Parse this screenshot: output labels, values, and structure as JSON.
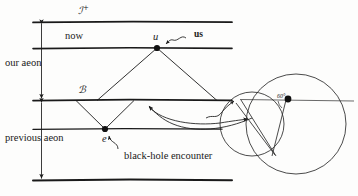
{
  "figure": {
    "type": "conformal-cyclic-cosmology-spacetime-diagram",
    "background_color": "#fdfdfc",
    "ink_color": "#1a1a1a"
  },
  "labels": {
    "scri_plus": "ℐ",
    "scri_plus_sup": "+",
    "now": "now",
    "us": "us",
    "u_point": "u",
    "our_aeon": "our aeon",
    "crossover_B": "ℬ",
    "previous_aeon": "previous aeon",
    "e_point": "e",
    "black_hole_encounter": "black-hole encounter",
    "angle_sixty": "60°"
  },
  "structure": {
    "horizontal_lines": [
      {
        "name": "scri-plus-line",
        "y": 22,
        "x1": 33,
        "x2": 232,
        "weight": 1.6
      },
      {
        "name": "now-line",
        "y": 48,
        "x1": 33,
        "x2": 232,
        "weight": 1.6
      },
      {
        "name": "crossover-line",
        "y": 100,
        "x1": 33,
        "x2": 232,
        "weight": 1.6
      },
      {
        "name": "previous-now-line",
        "y": 129,
        "x1": 33,
        "x2": 222,
        "weight": 1.2
      },
      {
        "name": "bottom-line",
        "y": 180,
        "x1": 33,
        "x2": 232,
        "weight": 1.8
      }
    ],
    "points": [
      {
        "name": "u",
        "x": 157,
        "y": 48
      },
      {
        "name": "e",
        "x": 105,
        "y": 129
      },
      {
        "name": "inset-dot",
        "x": 288,
        "y": 99
      }
    ],
    "light_cones": [
      {
        "name": "cone-from-u",
        "apex_x": 157,
        "apex_y": 48,
        "left_x": 98,
        "right_x": 216,
        "base_y": 100
      },
      {
        "name": "cone-from-e",
        "apex_x": 105,
        "apex_y": 129,
        "left_x": 76,
        "right_x": 134,
        "base_y": 100
      }
    ],
    "aeon_measures": [
      {
        "name": "our-aeon-measure",
        "x": 41,
        "y1": 22,
        "y2": 100
      },
      {
        "name": "previous-aeon-measure",
        "x": 41,
        "y1": 102,
        "y2": 180
      }
    ],
    "inset": {
      "big_circle": {
        "cx": 295,
        "cy": 124,
        "r": 50
      },
      "small_circle": {
        "cx": 252,
        "cy": 124,
        "r": 32
      },
      "axis_line": {
        "x1": 243,
        "y1": 99,
        "x2": 352,
        "y2": 101
      }
    }
  }
}
